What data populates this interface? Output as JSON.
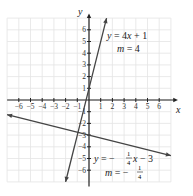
{
  "chart_data": {
    "type": "line",
    "title": "",
    "xlabel": "x",
    "ylabel": "y",
    "xlim": [
      -7,
      7
    ],
    "ylim": [
      -7,
      7
    ],
    "grid": true,
    "x_ticks": [
      -6,
      -5,
      -4,
      -3,
      -2,
      -1,
      1,
      2,
      3,
      4,
      5,
      6
    ],
    "y_ticks": [
      -6,
      -5,
      -4,
      -3,
      -2,
      -1,
      1,
      2,
      3,
      4,
      5,
      6
    ],
    "x_tick_labels": [
      "−6",
      "−5",
      "−4",
      "−3",
      "−2",
      "−1",
      "1",
      "2",
      "3",
      "4",
      "5",
      "6"
    ],
    "y_tick_labels": [
      "−6",
      "−5",
      "−4",
      "−3",
      "−2",
      "−1",
      "1",
      "2",
      "3",
      "4",
      "5",
      "6"
    ],
    "series": [
      {
        "name": "y = 4x + 1",
        "slope": 4,
        "intercept": 1,
        "slope_label": "m = 4",
        "x": [
          -2,
          1.5
        ],
        "y": [
          -7,
          7
        ]
      },
      {
        "name": "y = −(1/4)x − 3",
        "slope": -0.25,
        "intercept": -3,
        "slope_label": "m = −1/4",
        "x": [
          -7,
          7
        ],
        "y": [
          -1.25,
          -4.75
        ]
      }
    ],
    "annotations": [
      {
        "text": "y = 4x + 1",
        "position": "upper right of steep line"
      },
      {
        "text": "m = 4",
        "position": "below first equation"
      },
      {
        "text": "y = −¼x − 3",
        "position": "lower right"
      },
      {
        "text": "m = −¼",
        "position": "below second equation"
      }
    ]
  },
  "labels": {
    "x_axis": "x",
    "y_axis": "y",
    "eq1_y": "y",
    "eq1_rest": " = 4",
    "eq1_x": "x",
    "eq1_tail": " + 1",
    "m1_m": "m",
    "m1_rest": " = 4",
    "eq2_y": "y",
    "eq2_mid": " = −",
    "eq2_x": "x",
    "eq2_tail": " − 3",
    "m2_m": "m",
    "m2_mid": " = −",
    "frac_num": "1",
    "frac_den": "4"
  }
}
